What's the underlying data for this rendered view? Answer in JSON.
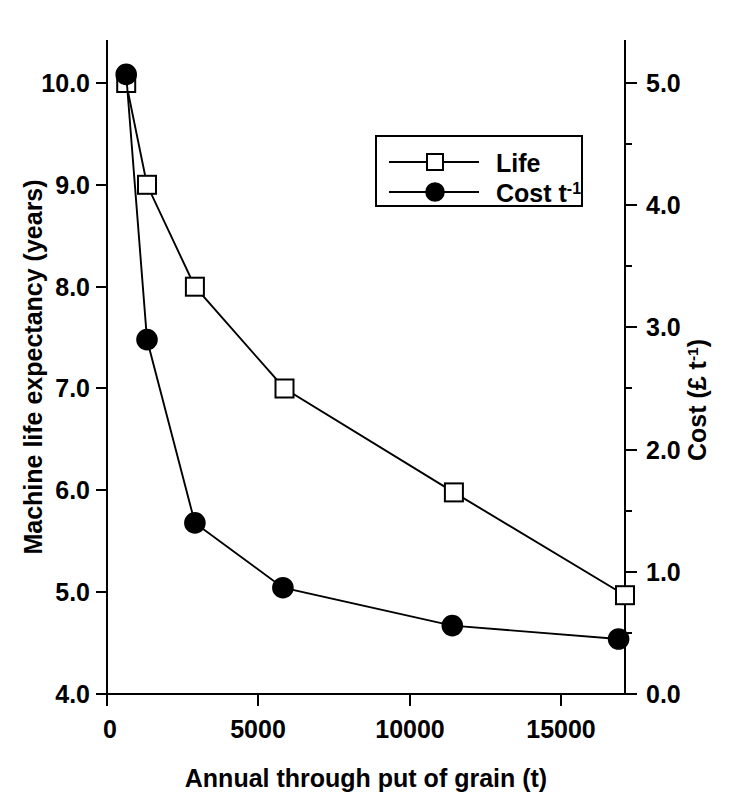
{
  "chart_data": {
    "type": "line",
    "title": "",
    "xlabel": "Annual through put of grain (t)",
    "ylabel": "Machine life expectancy (years)",
    "y2label": "Cost (£ t⁻¹)",
    "xlim": [
      0,
      16200
    ],
    "ylim": [
      4.0,
      10.2
    ],
    "y2lim": [
      0.0,
      5.2
    ],
    "xticks": [
      0,
      5000,
      10000,
      15000
    ],
    "xticklabels": [
      "0",
      "5000",
      "10000",
      "15000"
    ],
    "yticks": [
      4.0,
      5.0,
      6.0,
      7.0,
      8.0,
      9.0,
      10.0
    ],
    "yticklabels": [
      "4.0",
      "5.0",
      "6.0",
      "7.0",
      "8.0",
      "9.0",
      "10.0"
    ],
    "y2ticks": [
      0.0,
      1.0,
      2.0,
      3.0,
      4.0,
      5.0
    ],
    "y2ticklabels": [
      "0.0",
      "1.0",
      "2.0",
      "3.0",
      "4.0",
      "5.0"
    ],
    "y2minorticks": [
      0.5,
      1.5,
      2.5,
      3.5,
      4.5
    ],
    "grid": false,
    "legend_position": "upper-center",
    "series": [
      {
        "name": "Life",
        "axis": "left",
        "marker": "open-square",
        "x": [
          600,
          1250,
          2750,
          5550,
          10850,
          16200
        ],
        "values": [
          10.0,
          9.0,
          8.0,
          7.0,
          5.98,
          4.97
        ]
      },
      {
        "name": "Cost t⁻¹",
        "axis": "right",
        "marker": "filled-circle",
        "x": [
          600,
          1250,
          2750,
          5500,
          10800,
          16000
        ],
        "values": [
          5.07,
          2.9,
          1.4,
          0.87,
          0.56,
          0.45
        ]
      }
    ],
    "legend": [
      {
        "label": "Life",
        "marker": "open-square"
      },
      {
        "label": "Cost t",
        "superscript": "-1",
        "marker": "filled-circle"
      }
    ]
  },
  "axes": {
    "x_title": "Annual through put of grain (t)",
    "y_left_title": "Machine life expectancy (years)",
    "y_right_title_base": "Cost (£ t",
    "y_right_title_sup": "-1",
    "y_right_title_close": ")"
  }
}
